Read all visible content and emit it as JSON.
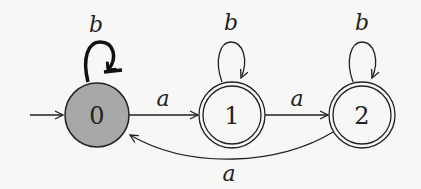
{
  "diagram": {
    "type": "finite-automaton",
    "colors": {
      "background": "#f7f7f5",
      "stroke": "#222222",
      "start_state_fill": "#a8a8a8",
      "accept_state_fill": "#f7f7f5",
      "highlight_loop": "#111111"
    },
    "states": [
      {
        "id": "0",
        "label": "0",
        "initial": true,
        "accepting": false,
        "highlighted": true
      },
      {
        "id": "1",
        "label": "1",
        "initial": false,
        "accepting": true,
        "highlighted": false
      },
      {
        "id": "2",
        "label": "2",
        "initial": false,
        "accepting": true,
        "highlighted": false
      }
    ],
    "transitions": [
      {
        "from": "0",
        "to": "0",
        "symbol": "b",
        "highlighted": true
      },
      {
        "from": "0",
        "to": "1",
        "symbol": "a"
      },
      {
        "from": "1",
        "to": "1",
        "symbol": "b"
      },
      {
        "from": "1",
        "to": "2",
        "symbol": "a"
      },
      {
        "from": "2",
        "to": "2",
        "symbol": "b"
      },
      {
        "from": "2",
        "to": "0",
        "symbol": "a"
      }
    ]
  }
}
